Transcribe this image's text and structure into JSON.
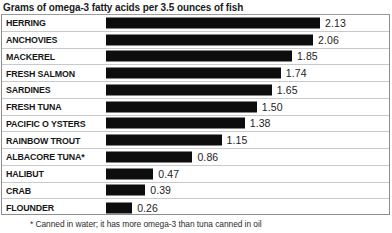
{
  "chart_data": {
    "type": "bar",
    "orientation": "horizontal",
    "title": "Grams of omega-3 fatty acids per 3.5 ounces of fish",
    "subtitle": "",
    "xlabel": "",
    "ylabel": "",
    "grid": false,
    "legend": "none",
    "xlim": [
      0,
      2.13
    ],
    "value_label_format": "2 decimals",
    "footnote": "* Canned in water; it has more omega-3 than tuna canned in oil",
    "categories": [
      "HERRING",
      "ANCHOVIES",
      "MACKEREL",
      "FRESH SALMON",
      "SARDINES",
      "FRESH TUNA",
      "PACIFIC O YSTERS",
      "RAINBOW TROUT",
      "ALBACORE TUNA*",
      "HALIBUT",
      "CRAB",
      "FLOUNDER"
    ],
    "values": [
      2.13,
      2.06,
      1.85,
      1.74,
      1.65,
      1.5,
      1.38,
      1.15,
      0.86,
      0.47,
      0.39,
      0.26
    ],
    "value_labels": [
      "2.13",
      "2.06",
      "1.85",
      "1.74",
      "1.65",
      "1.50",
      "1.38",
      "1.15",
      "0.86",
      "0.47",
      "0.39",
      "0.26"
    ],
    "bar_color": "#0d0d0d",
    "background_color": "#ffffff",
    "border_color": "#8d8d8d",
    "separator_color": "#c9c9c9",
    "text_color": "#1a1a1a"
  },
  "rows": [
    {
      "label": "HERRING",
      "value": 2.13,
      "value_label": "2.13"
    },
    {
      "label": "ANCHOVIES",
      "value": 2.06,
      "value_label": "2.06"
    },
    {
      "label": "MACKEREL",
      "value": 1.85,
      "value_label": "1.85"
    },
    {
      "label": "FRESH SALMON",
      "value": 1.74,
      "value_label": "1.74"
    },
    {
      "label": "SARDINES",
      "value": 1.65,
      "value_label": "1.65"
    },
    {
      "label": "FRESH TUNA",
      "value": 1.5,
      "value_label": "1.50"
    },
    {
      "label": "PACIFIC O YSTERS",
      "value": 1.38,
      "value_label": "1.38"
    },
    {
      "label": "RAINBOW TROUT",
      "value": 1.15,
      "value_label": "1.15"
    },
    {
      "label": "ALBACORE TUNA*",
      "value": 0.86,
      "value_label": "0.86"
    },
    {
      "label": "HALIBUT",
      "value": 0.47,
      "value_label": "0.47"
    },
    {
      "label": "CRAB",
      "value": 0.39,
      "value_label": "0.39"
    },
    {
      "label": "FLOUNDER",
      "value": 0.26,
      "value_label": "0.26"
    }
  ],
  "layout": {
    "bar_origin_x": 104,
    "px_per_unit": 100.5,
    "bar_min_px": 23,
    "row_height": 16.75,
    "value_gap_px": 5
  }
}
